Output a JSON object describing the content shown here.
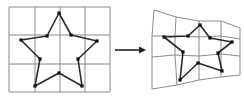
{
  "diagram": {
    "colors": {
      "grid": "#8a8a8a",
      "star": "#2a2a2a",
      "arrow": "#222222",
      "background": "#ffffff"
    },
    "left": {
      "grid_cols": 4,
      "grid_rows": 3,
      "grid_x": [
        9,
        35,
        60,
        85,
        110
      ],
      "grid_y": [
        7,
        35,
        64,
        92
      ],
      "star_points": [
        [
          59,
          13
        ],
        [
          71,
          35
        ],
        [
          97,
          41
        ],
        [
          78,
          59
        ],
        [
          82,
          86
        ],
        [
          59,
          73
        ],
        [
          35,
          86
        ],
        [
          40,
          59
        ],
        [
          21,
          40
        ],
        [
          47,
          36
        ]
      ]
    },
    "arrow": {
      "x1": 115,
      "y1": 50,
      "x2": 146,
      "y2": 50
    },
    "right": {
      "grid_points": [
        [
          [
            154,
            10
          ],
          [
            176,
            17
          ],
          [
            199,
            21
          ],
          [
            221,
            21
          ],
          [
            240,
            28
          ]
        ],
        [
          [
            152,
            36
          ],
          [
            175,
            36
          ],
          [
            199,
            37
          ],
          [
            221,
            36
          ],
          [
            240,
            39
          ]
        ],
        [
          [
            152,
            57
          ],
          [
            175,
            55
          ],
          [
            199,
            56
          ],
          [
            221,
            54
          ],
          [
            240,
            56
          ]
        ],
        [
          [
            152,
            89
          ],
          [
            177,
            85
          ],
          [
            199,
            80
          ],
          [
            221,
            77
          ],
          [
            240,
            75
          ]
        ]
      ],
      "star_points": [
        [
          200,
          25
        ],
        [
          210,
          38
        ],
        [
          232,
          42
        ],
        [
          218,
          53
        ],
        [
          222,
          71
        ],
        [
          198,
          63
        ],
        [
          180,
          80
        ],
        [
          183,
          52
        ],
        [
          164,
          37
        ],
        [
          188,
          36
        ]
      ]
    }
  }
}
